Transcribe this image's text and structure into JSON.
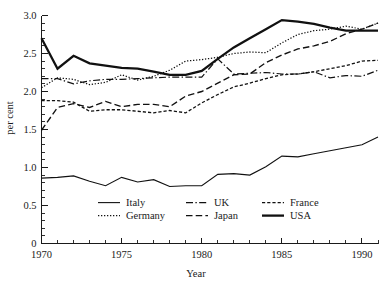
{
  "chart_data": {
    "type": "line",
    "title": "",
    "xlabel": "Year",
    "ylabel": "per cent",
    "xlim": [
      1970,
      1991
    ],
    "ylim": [
      0,
      3.0
    ],
    "xticks": [
      1970,
      1975,
      1980,
      1985,
      1990
    ],
    "xtick_labels": [
      "1970",
      "1975",
      "1980",
      "1985",
      "1990"
    ],
    "yticks": [
      0,
      0.5,
      1.0,
      1.5,
      2.0,
      2.5,
      3.0
    ],
    "ytick_labels": [
      "0",
      "0.5",
      "1.0",
      "1.5",
      "2.0",
      "2.5",
      "3.0"
    ],
    "y_minor_step": 0.1,
    "x_minor_step": 1,
    "grid": false,
    "legend_position": "inside-lower-center",
    "x": [
      1970,
      1971,
      1972,
      1973,
      1974,
      1975,
      1976,
      1977,
      1978,
      1979,
      1980,
      1981,
      1982,
      1983,
      1984,
      1985,
      1986,
      1987,
      1988,
      1989,
      1990,
      1991
    ],
    "series": [
      {
        "name": "Italy",
        "style": "solid-thin",
        "values": [
          0.86,
          0.87,
          0.89,
          0.82,
          0.76,
          0.87,
          0.81,
          0.84,
          0.75,
          0.76,
          0.76,
          0.91,
          0.92,
          0.9,
          1.01,
          1.15,
          1.14,
          1.18,
          1.22,
          1.26,
          1.3,
          1.4
        ]
      },
      {
        "name": "Germany",
        "style": "dotted",
        "values": [
          2.05,
          2.18,
          2.16,
          2.09,
          2.12,
          2.22,
          2.15,
          2.2,
          2.28,
          2.4,
          2.42,
          2.45,
          2.5,
          2.52,
          2.51,
          2.64,
          2.75,
          2.8,
          2.82,
          2.86,
          2.82,
          2.9
        ]
      },
      {
        "name": "UK",
        "style": "dashdot",
        "values": [
          2.17,
          2.17,
          2.1,
          2.14,
          2.16,
          2.16,
          2.17,
          2.18,
          2.19,
          2.19,
          2.19,
          2.43,
          2.23,
          2.24,
          2.25,
          2.23,
          2.23,
          2.26,
          2.18,
          2.21,
          2.2,
          2.28
        ]
      },
      {
        "name": "Japan",
        "style": "dash-long",
        "values": [
          1.49,
          1.79,
          1.84,
          1.79,
          1.87,
          1.8,
          1.83,
          1.83,
          1.8,
          1.94,
          2.0,
          2.11,
          2.22,
          2.23,
          2.38,
          2.48,
          2.56,
          2.6,
          2.66,
          2.76,
          2.82,
          2.9
        ]
      },
      {
        "name": "France",
        "style": "dash-short",
        "values": [
          1.88,
          1.88,
          1.86,
          1.74,
          1.76,
          1.76,
          1.74,
          1.72,
          1.75,
          1.72,
          1.85,
          1.96,
          2.06,
          2.11,
          2.17,
          2.22,
          2.23,
          2.26,
          2.3,
          2.34,
          2.4,
          2.41
        ]
      },
      {
        "name": "USA",
        "style": "solid-thick",
        "values": [
          2.7,
          2.3,
          2.47,
          2.37,
          2.34,
          2.31,
          2.3,
          2.26,
          2.22,
          2.22,
          2.27,
          2.43,
          2.58,
          2.7,
          2.82,
          2.94,
          2.92,
          2.89,
          2.84,
          2.8,
          2.8,
          2.8
        ]
      }
    ],
    "legend": [
      {
        "name": "Italy",
        "style": "solid-thin"
      },
      {
        "name": "UK",
        "style": "dashdot"
      },
      {
        "name": "France",
        "style": "dash-short"
      },
      {
        "name": "Germany",
        "style": "dotted"
      },
      {
        "name": "Japan",
        "style": "dash-long"
      },
      {
        "name": "USA",
        "style": "solid-thick"
      }
    ],
    "colors": {
      "line": "#111111",
      "axis": "#1a1a1a",
      "background": "#ffffff"
    }
  }
}
